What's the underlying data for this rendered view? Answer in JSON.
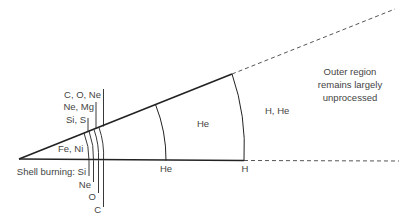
{
  "diagram": {
    "type": "onion-shell star cross-section",
    "colors": {
      "line": "#222222",
      "text": "#444444",
      "dashed": "#555555"
    },
    "core_label": "Fe, Ni",
    "shell_burning_prefix": "Shell burning: Si",
    "shell_burning_labels": [
      "Ne",
      "O",
      "C"
    ],
    "upper_labels": [
      "C, O, Ne",
      "Ne, Mg",
      "Si, S"
    ],
    "he_zone_label": "He",
    "he_shell_label": "He",
    "h_shell_label": "H",
    "envelope_label": "H, He",
    "outer_note": [
      "Outer region",
      "remains largely",
      "unprocessed"
    ]
  }
}
